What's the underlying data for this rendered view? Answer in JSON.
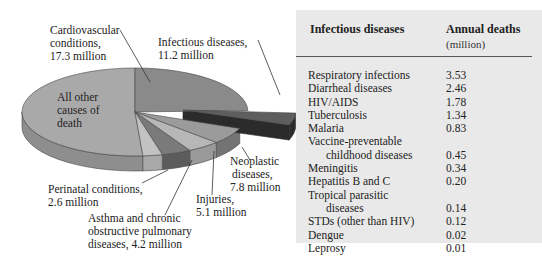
{
  "chart_data": [
    {
      "type": "pie",
      "title": "",
      "style": "3d-exploded",
      "exploded_slice": "Infectious diseases",
      "units": "million annual deaths",
      "categories": [
        "Cardiovascular conditions",
        "Infectious diseases",
        "Neoplastic diseases",
        "Injuries",
        "Asthma and chronic obstructive pulmonary diseases",
        "Perinatal conditions",
        "All other causes of death"
      ],
      "values": [
        17.3,
        11.2,
        7.8,
        5.1,
        4.2,
        2.6,
        null
      ],
      "labels": [
        "Cardiovascular conditions, 17.3 million",
        "Infectious diseases, 11.2 million",
        "Neoplastic diseases, 7.8 million",
        "Injuries, 5.1 million",
        "Asthma and chronic obstructive pulmonary diseases, 4.2 million",
        "Perinatal conditions, 2.6 million",
        "All other causes of death"
      ]
    },
    {
      "type": "table",
      "columns": [
        "Infectious diseases",
        "Annual deaths (million)"
      ],
      "rows": [
        [
          "Respiratory infections",
          3.53
        ],
        [
          "Diarrheal diseases",
          2.46
        ],
        [
          "HIV/AIDS",
          1.78
        ],
        [
          "Tuberculosis",
          1.34
        ],
        [
          "Malaria",
          0.83
        ],
        [
          "Vaccine-preventable childhood diseases",
          0.45
        ],
        [
          "Meningitis",
          0.34
        ],
        [
          "Hepatitis B and C",
          0.2
        ],
        [
          "Tropical parasitic diseases",
          0.14
        ],
        [
          "STDs (other than HIV)",
          0.12
        ],
        [
          "Dengue",
          0.02
        ],
        [
          "Leprosy",
          0.01
        ]
      ]
    }
  ],
  "pie": {
    "labels": {
      "cardio": [
        "Cardiovascular",
        "conditions,",
        "17.3 million"
      ],
      "infectious": [
        "Infectious diseases,",
        "11.2 million"
      ],
      "other": [
        "All other",
        "causes of",
        "death"
      ],
      "neoplastic": [
        "Neoplastic",
        "diseases,",
        "7.8 million"
      ],
      "injuries": [
        "Injuries,",
        "5.1 million"
      ],
      "perinatal": [
        "Perinatal conditions,",
        "2.6 million"
      ],
      "asthma": [
        "Asthma and chronic",
        "obstructive pulmonary",
        "diseases, 4.2 million"
      ]
    },
    "colors": {
      "other_top": "#a9a9a9",
      "other_side": "#8e8e8e",
      "cardio_top": "#8a8a8a",
      "cardio_side": "#6e6e6e",
      "infectious_top": "#5e5e5e",
      "infectious_side": "#2b2b2b",
      "neoplastic_top": "#9b9b9b",
      "neoplastic_side": "#747474",
      "injuries_top": "#b7b7b7",
      "injuries_side": "#9a9a9a",
      "asthma_top": "#7a7a7a",
      "asthma_side": "#5c5c5c",
      "perinatal_top": "#c2c2c2",
      "perinatal_side": "#a8a8a8"
    }
  },
  "table": {
    "header_name": "Infectious diseases",
    "header_value": "Annual deaths",
    "header_unit": "(million)",
    "rows": [
      {
        "name": "Respiratory infections",
        "value": "3.53"
      },
      {
        "name": "Diarrheal diseases",
        "value": "2.46"
      },
      {
        "name": "HIV/AIDS",
        "value": "1.78"
      },
      {
        "name": "Tuberculosis",
        "value": "1.34"
      },
      {
        "name": "Malaria",
        "value": "0.83"
      },
      {
        "name": "Vaccine-preventable",
        "value": ""
      },
      {
        "name": "childhood diseases",
        "value": "0.45",
        "indent": true
      },
      {
        "name": "Meningitis",
        "value": "0.34"
      },
      {
        "name": "Hepatitis B and C",
        "value": "0.20"
      },
      {
        "name": "Tropical parasitic",
        "value": ""
      },
      {
        "name": "diseases",
        "value": "0.14",
        "indent": true
      },
      {
        "name": "STDs (other than HIV)",
        "value": "0.12"
      },
      {
        "name": "Dengue",
        "value": "0.02"
      },
      {
        "name": "Leprosy",
        "value": "0.01"
      }
    ]
  }
}
